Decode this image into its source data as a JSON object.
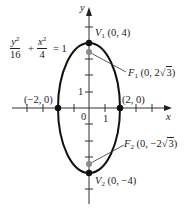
{
  "diagram": {
    "equation": {
      "term1_num_var": "y",
      "term1_num_exp": "2",
      "term1_den": "16",
      "plus": "+",
      "term2_num_var": "x",
      "term2_num_exp": "2",
      "term2_den": "4",
      "equals": "= 1"
    },
    "axes": {
      "x_label": "x",
      "y_label": "y",
      "origin_label": "0",
      "x_tick_label": "1",
      "y_tick_label": "1"
    },
    "points": {
      "v1": {
        "name": "V",
        "sub": "1",
        "coords": "(0, 4)"
      },
      "v2": {
        "name": "V",
        "sub": "2",
        "coords": "(0, −4)"
      },
      "f1": {
        "name": "F",
        "sub": "1",
        "coords_pre": "(0, 2",
        "radicand": "3",
        "coords_post": ")"
      },
      "f2": {
        "name": "F",
        "sub": "2",
        "coords_pre": "(0, −2",
        "radicand": "3",
        "coords_post": ")"
      },
      "left": {
        "coords": "(−2, 0)"
      },
      "right": {
        "coords": "(2, 0)"
      }
    },
    "colors": {
      "curve": "#111111",
      "axis": "#333333",
      "vertex_dot": "#111111",
      "focus_dot": "#8a8a8a"
    }
  }
}
